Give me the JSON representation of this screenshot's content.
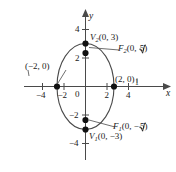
{
  "figure": {
    "type": "ellipse-conic-graph",
    "background": "#ffffff",
    "ink_color": "#1a1a1a"
  },
  "axes": {
    "x_axis_label": "x",
    "y_axis_label": "y",
    "origin_label": "0",
    "x_ticks": [
      {
        "value": -4,
        "label": "−4"
      },
      {
        "value": -2,
        "label": "−2"
      },
      {
        "value": 2,
        "label": "2"
      },
      {
        "value": 4,
        "label": "4"
      }
    ],
    "y_ticks": [
      {
        "value": 4,
        "label": "4"
      },
      {
        "value": 2,
        "label": "2"
      },
      {
        "value": -2,
        "label": "−2"
      },
      {
        "value": -4,
        "label": "−4"
      }
    ],
    "stray_mark_label": "1"
  },
  "curve": {
    "shape": "ellipse",
    "center": [
      0,
      0
    ],
    "semi_axis_x": 2,
    "semi_axis_y": 3
  },
  "points": [
    {
      "name": "vertex-upper",
      "symbol": "V",
      "subscript": "2",
      "coords_text": "(0, 3)",
      "label_text": "V₂(0, 3)",
      "x": 0,
      "y": 3
    },
    {
      "name": "focus-upper",
      "symbol": "F",
      "subscript": "2",
      "coords_text": "(0, √5)",
      "label_text": "F₂(0, √5)",
      "x": 0,
      "y": 2.236
    },
    {
      "name": "covertex-left",
      "symbol": "",
      "subscript": "",
      "coords_text": "(−2, 0)",
      "label_text": "(−2, 0)",
      "x": -2,
      "y": 0
    },
    {
      "name": "covertex-right",
      "symbol": "",
      "subscript": "",
      "coords_text": "(2, 0)",
      "label_text": "(2, 0)",
      "x": 2,
      "y": 0
    },
    {
      "name": "focus-lower",
      "symbol": "F",
      "subscript": "1",
      "coords_text": "(0, −√5)",
      "label_text": "F₁(0, −√5)",
      "x": 0,
      "y": -2.236
    },
    {
      "name": "vertex-lower",
      "symbol": "V",
      "subscript": "1",
      "coords_text": "(0, −3)",
      "label_text": "V₁(0, −3)",
      "x": 0,
      "y": -3
    }
  ],
  "labels": {
    "v2_var": "V",
    "v2_sub": "2",
    "v2_coords": "(0, 3)",
    "f2_var": "F",
    "f2_sub": "2",
    "f2_pre": "(0, ",
    "f2_radicand": "5",
    "f2_post": ")",
    "left_point": "(−2, 0)",
    "right_point": "(2, 0)",
    "f1_var": "F",
    "f1_sub": "1",
    "f1_pre": "(0, −",
    "f1_radicand": "5",
    "f1_post": ")",
    "v1_var": "V",
    "v1_sub": "1",
    "v1_coords": "(0, −3)"
  }
}
